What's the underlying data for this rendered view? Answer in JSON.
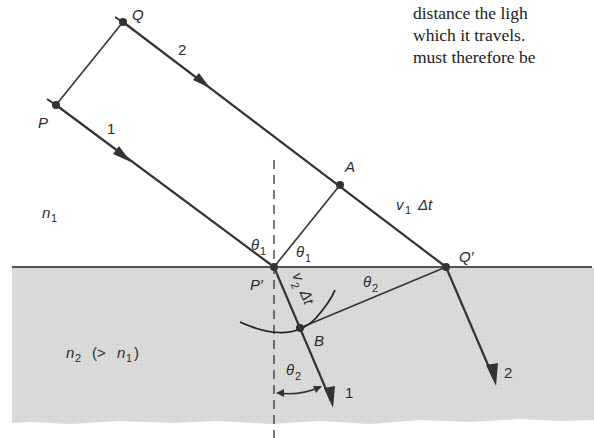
{
  "domain": "Diagram",
  "figure": {
    "colors": {
      "ray": "#333333",
      "medium2_fill": "#d8d8d8",
      "boundary": "#1a1a1a",
      "text": "#2a2a2a"
    },
    "points": {
      "Q": "Q",
      "P": "P",
      "A": "A",
      "P_prime": "P′",
      "Q_prime": "Q′",
      "B": "B"
    },
    "rays": {
      "ray1_incident": "1",
      "ray2_incident": "2",
      "ray1_refracted": "1",
      "ray2_refracted": "2"
    },
    "angles": {
      "theta1_incident_sub": "1",
      "theta1_wavefront_sub": "1",
      "theta2_wavefront_sub": "2",
      "theta2_refracted_sub": "2",
      "theta_symbol": "θ"
    },
    "distances": {
      "v1_dt_v": "v",
      "v1_dt_sub": "1",
      "v1_dt_tail": "Δt",
      "v2_dt_v": "v",
      "v2_dt_sub": "2",
      "v2_dt_tail": "Δt"
    },
    "media": {
      "n1_n": "n",
      "n1_sub": "1",
      "n2_n": "n",
      "n2_sub": "2",
      "n2_relation_open": "(>",
      "n2_relation_n": "n",
      "n2_relation_sub": "1",
      "n2_relation_close": ")"
    }
  },
  "page_text": {
    "lines": [
      "distance the ligh",
      "which it travels.",
      "must therefore be"
    ]
  }
}
